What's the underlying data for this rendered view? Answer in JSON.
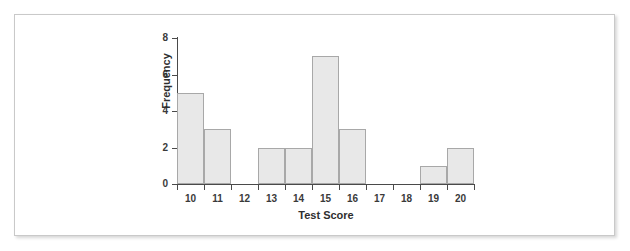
{
  "figure": {
    "frame_border_color": "#c9c9c9",
    "background_color": "#ffffff"
  },
  "chart_data": {
    "type": "bar",
    "title": "",
    "subtitle": "",
    "xlabel": "Test Score",
    "ylabel": "Frequency",
    "categories": [
      "10",
      "11",
      "12",
      "13",
      "14",
      "15",
      "16",
      "17",
      "18",
      "19",
      "20"
    ],
    "values": [
      5,
      3,
      0,
      2,
      2,
      7,
      3,
      0,
      0,
      1,
      2
    ],
    "xlim": [
      9.5,
      20.5
    ],
    "ylim": [
      0,
      8
    ],
    "y_ticks": [
      "0",
      "2",
      "4",
      "6",
      "8"
    ],
    "y_tick_values": [
      0,
      2,
      4,
      6,
      8
    ],
    "x_ticks": [
      "10",
      "11",
      "12",
      "13",
      "14",
      "15",
      "16",
      "17",
      "18",
      "19",
      "20"
    ],
    "bin_width": 1,
    "grid": false,
    "legend": false,
    "legend_position": "none",
    "bar_fill_color": "#e8e8e8",
    "bar_border_color": "#a8a8a8",
    "axis_color": "#4a4a4a",
    "label_color": "#2f2f2f"
  }
}
